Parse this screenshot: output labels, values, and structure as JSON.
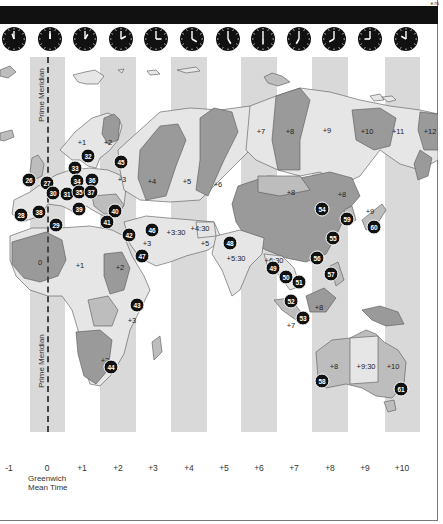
{
  "header": {
    "page_id": "e.ru"
  },
  "clocks": [
    {
      "offset": "-1",
      "hour_angle": -20,
      "minute_angle": 0
    },
    {
      "offset": "0",
      "hour_angle": 0,
      "minute_angle": 0
    },
    {
      "offset": "+1",
      "hour_angle": 30,
      "minute_angle": 0
    },
    {
      "offset": "+2",
      "hour_angle": 60,
      "minute_angle": 0
    },
    {
      "offset": "+3",
      "hour_angle": 90,
      "minute_angle": 0
    },
    {
      "offset": "+4",
      "hour_angle": 120,
      "minute_angle": 0
    },
    {
      "offset": "+5",
      "hour_angle": 150,
      "minute_angle": 0
    },
    {
      "offset": "+6",
      "hour_angle": 180,
      "minute_angle": 0
    },
    {
      "offset": "+7",
      "hour_angle": 210,
      "minute_angle": 0
    },
    {
      "offset": "+8",
      "hour_angle": 240,
      "minute_angle": 0
    },
    {
      "offset": "+9",
      "hour_angle": 270,
      "minute_angle": 0
    },
    {
      "offset": "+10",
      "hour_angle": 300,
      "minute_angle": 0
    }
  ],
  "meridian": {
    "label_top": "Prime Meridian",
    "label_bottom": "Prime Meridian"
  },
  "zone_labels": [
    {
      "text": "+1",
      "x": 82,
      "y": 142
    },
    {
      "text": "+2",
      "x": 108,
      "y": 142
    },
    {
      "text": "+3",
      "x": 122,
      "y": 179
    },
    {
      "text": "+4",
      "x": 152,
      "y": 181
    },
    {
      "text": "+5",
      "x": 187,
      "y": 181
    },
    {
      "text": "+6",
      "x": 218,
      "y": 184
    },
    {
      "text": "+7",
      "x": 261,
      "y": 131
    },
    {
      "text": "+8",
      "x": 290,
      "y": 131
    },
    {
      "text": "+9",
      "x": 327,
      "y": 130
    },
    {
      "text": "+10",
      "x": 367,
      "y": 131
    },
    {
      "text": "+11",
      "x": 398,
      "y": 131
    },
    {
      "text": "+12",
      "x": 430,
      "y": 131
    },
    {
      "text": "+3:30",
      "x": 176,
      "y": 232
    },
    {
      "text": "+4:30",
      "x": 200,
      "y": 228
    },
    {
      "text": "+5",
      "x": 205,
      "y": 243
    },
    {
      "text": "+5:30",
      "x": 236,
      "y": 258
    },
    {
      "text": "+3",
      "x": 147,
      "y": 243
    },
    {
      "text": "+2",
      "x": 120,
      "y": 267
    },
    {
      "text": "+8",
      "x": 291,
      "y": 192
    },
    {
      "text": "+8",
      "x": 342,
      "y": 194
    },
    {
      "text": "+8",
      "x": 319,
      "y": 307
    },
    {
      "text": "+9",
      "x": 370,
      "y": 211
    },
    {
      "text": "+6:30",
      "x": 274,
      "y": 260
    },
    {
      "text": "+7",
      "x": 291,
      "y": 325
    },
    {
      "text": "0",
      "x": 40,
      "y": 262
    },
    {
      "text": "+1",
      "x": 80,
      "y": 265
    },
    {
      "text": "+3",
      "x": 132,
      "y": 320
    },
    {
      "text": "+2",
      "x": 105,
      "y": 360
    },
    {
      "text": "+8",
      "x": 334,
      "y": 366
    },
    {
      "text": "+9:30",
      "x": 366,
      "y": 366
    },
    {
      "text": "+10",
      "x": 393,
      "y": 366
    }
  ],
  "pins": [
    {
      "n": "26",
      "x": 29,
      "y": 180
    },
    {
      "n": "27",
      "x": 47,
      "y": 183
    },
    {
      "n": "28",
      "x": 21,
      "y": 215
    },
    {
      "n": "29",
      "x": 56,
      "y": 225
    },
    {
      "n": "30",
      "x": 53,
      "y": 193
    },
    {
      "n": "31",
      "x": 67,
      "y": 194
    },
    {
      "n": "32",
      "x": 88,
      "y": 156
    },
    {
      "n": "33",
      "x": 75,
      "y": 168
    },
    {
      "n": "34",
      "x": 77,
      "y": 181
    },
    {
      "n": "35",
      "x": 79,
      "y": 192
    },
    {
      "n": "36",
      "x": 92,
      "y": 180
    },
    {
      "n": "37",
      "x": 91,
      "y": 192
    },
    {
      "n": "38",
      "x": 39,
      "y": 212
    },
    {
      "n": "39",
      "x": 79,
      "y": 209
    },
    {
      "n": "40",
      "x": 115,
      "y": 211
    },
    {
      "n": "41",
      "x": 107,
      "y": 222
    },
    {
      "n": "42",
      "x": 129,
      "y": 235
    },
    {
      "n": "43",
      "x": 137,
      "y": 305
    },
    {
      "n": "44",
      "x": 111,
      "y": 367
    },
    {
      "n": "45",
      "x": 121,
      "y": 162
    },
    {
      "n": "46",
      "x": 152,
      "y": 230
    },
    {
      "n": "47",
      "x": 142,
      "y": 256
    },
    {
      "n": "48",
      "x": 230,
      "y": 243
    },
    {
      "n": "49",
      "x": 273,
      "y": 268
    },
    {
      "n": "50",
      "x": 286,
      "y": 277
    },
    {
      "n": "51",
      "x": 299,
      "y": 282
    },
    {
      "n": "52",
      "x": 291,
      "y": 301
    },
    {
      "n": "53",
      "x": 303,
      "y": 318
    },
    {
      "n": "54",
      "x": 322,
      "y": 209
    },
    {
      "n": "55",
      "x": 333,
      "y": 238
    },
    {
      "n": "56",
      "x": 317,
      "y": 258
    },
    {
      "n": "57",
      "x": 331,
      "y": 274
    },
    {
      "n": "58",
      "x": 322,
      "y": 381
    },
    {
      "n": "59",
      "x": 347,
      "y": 219
    },
    {
      "n": "60",
      "x": 374,
      "y": 227
    },
    {
      "n": "61",
      "x": 401,
      "y": 389
    }
  ],
  "axis": {
    "labels": [
      {
        "text": "-1",
        "x": 9
      },
      {
        "text": "0",
        "x": 47
      },
      {
        "text": "+1",
        "x": 82
      },
      {
        "text": "+2",
        "x": 118
      },
      {
        "text": "+3",
        "x": 153
      },
      {
        "text": "+4",
        "x": 189
      },
      {
        "text": "+5",
        "x": 224
      },
      {
        "text": "+6",
        "x": 259
      },
      {
        "text": "+7",
        "x": 294
      },
      {
        "text": "+8",
        "x": 330
      },
      {
        "text": "+9",
        "x": 365
      },
      {
        "text": "+10",
        "x": 402
      }
    ],
    "gmt_line1": "Greenwich",
    "gmt_line2": "Mean Time"
  },
  "stripes": [
    {
      "x": 30,
      "w": 35
    },
    {
      "x": 100,
      "w": 36
    },
    {
      "x": 171,
      "w": 36
    },
    {
      "x": 241,
      "w": 36
    },
    {
      "x": 312,
      "w": 36
    },
    {
      "x": 385,
      "w": 35
    }
  ],
  "colors": {
    "stripe": "#d9d9d9",
    "land_light": "#e6e6e6",
    "land_mid": "#bdbdbd",
    "land_dark": "#9a9a9a",
    "pin": "#111111",
    "bar": "#111111"
  }
}
